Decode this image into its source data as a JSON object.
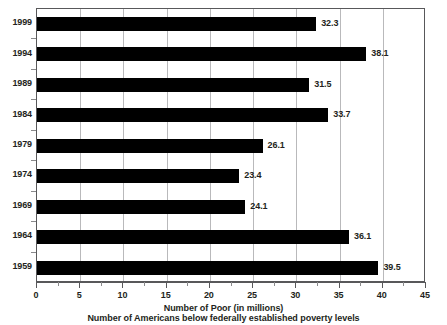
{
  "chart_data": {
    "type": "bar",
    "orientation": "horizontal",
    "title": "Number of Americans below federally established poverty levels",
    "xlabel": "Number of Poor (in millions)",
    "ylabel": "",
    "categories": [
      "1999",
      "1994",
      "1989",
      "1984",
      "1979",
      "1974",
      "1969",
      "1964",
      "1959"
    ],
    "values": [
      32.3,
      38.1,
      31.5,
      33.7,
      26.1,
      23.4,
      24.1,
      36.1,
      39.5
    ],
    "value_labels": [
      "32.3",
      "38.1",
      "31.5",
      "33.7",
      "26.1",
      "23.4",
      "24.1",
      "36.1",
      "39.5"
    ],
    "xlim": [
      0,
      45
    ],
    "xticks": [
      0,
      5,
      10,
      15,
      20,
      25,
      30,
      35,
      40,
      45
    ],
    "xtick_labels": [
      "0",
      "5",
      "10",
      "15",
      "20",
      "25",
      "30",
      "35",
      "40",
      "45"
    ],
    "grid": "vertical",
    "legend": null,
    "bar_color": "#000000",
    "gridline_color": "#b9b9bb",
    "frame_color": "#58585a",
    "text_color": "#231f20",
    "background": "#ffffff"
  },
  "axis_titles": {
    "line1": "Number of Poor (in millions)",
    "line2": "Number of Americans below federally established poverty levels"
  }
}
